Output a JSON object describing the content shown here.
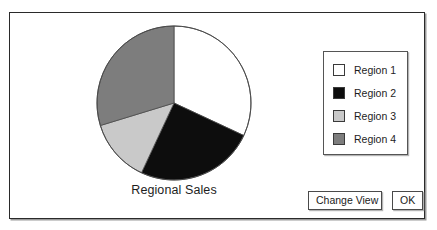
{
  "dialog": {
    "title": "",
    "background_color": "#ffffff",
    "border_color": "#2a2a2a"
  },
  "chart_data": {
    "type": "pie",
    "title": "Regional Sales",
    "xlabel": "",
    "ylabel": "",
    "legend_position": "right",
    "grid": false,
    "start_angle_deg": 0,
    "direction": "clockwise",
    "categories": [
      "Region 1",
      "Region 2",
      "Region 3",
      "Region 4"
    ],
    "values": [
      32,
      25,
      13,
      30
    ],
    "slice_angles_deg": [
      115,
      90,
      48,
      107
    ],
    "colors": [
      "#ffffff",
      "#0d0d0d",
      "#c9c9c9",
      "#7d7d7d"
    ],
    "slices": [
      {
        "label": "Region 1",
        "value": 32,
        "angle_deg": 115,
        "color": "#ffffff"
      },
      {
        "label": "Region 2",
        "value": 25,
        "angle_deg": 90,
        "color": "#0d0d0d"
      },
      {
        "label": "Region 3",
        "value": 13,
        "angle_deg": 48,
        "color": "#c9c9c9"
      },
      {
        "label": "Region 4",
        "value": 30,
        "angle_deg": 107,
        "color": "#7d7d7d"
      }
    ]
  },
  "legend": {
    "items": [
      {
        "label": "Region 1",
        "color": "#ffffff"
      },
      {
        "label": "Region 2",
        "color": "#0d0d0d"
      },
      {
        "label": "Region 3",
        "color": "#c9c9c9"
      },
      {
        "label": "Region 4",
        "color": "#7d7d7d"
      }
    ]
  },
  "buttons": {
    "change_view_label": "Change View",
    "ok_label": "OK"
  }
}
